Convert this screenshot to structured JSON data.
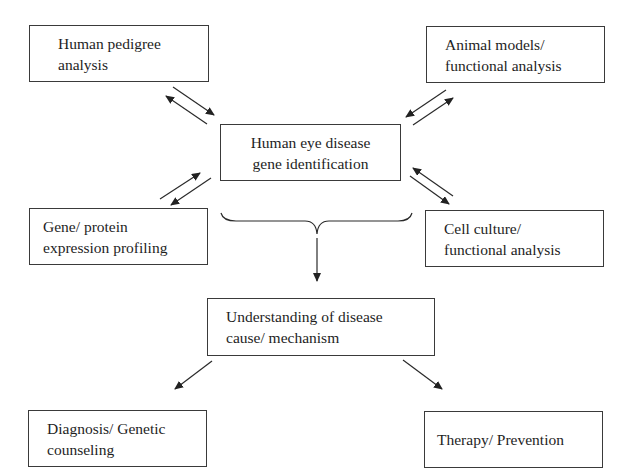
{
  "diagram": {
    "type": "flowchart",
    "nodes": [
      {
        "id": "pedigree",
        "label": "Human pedigree\nanalysis"
      },
      {
        "id": "animal",
        "label": "Animal models/\nfunctional analysis"
      },
      {
        "id": "center",
        "label": "Human eye disease\ngene identification"
      },
      {
        "id": "expression",
        "label": "Gene/ protein\nexpression profiling"
      },
      {
        "id": "cell",
        "label": "Cell culture/\nfunctional analysis"
      },
      {
        "id": "understanding",
        "label": "Understanding of disease\ncause/ mechanism"
      },
      {
        "id": "diagnosis",
        "label": "Diagnosis/ Genetic\ncounseling"
      },
      {
        "id": "therapy",
        "label": "Therapy/ Prevention"
      }
    ],
    "edges": [
      {
        "from": "pedigree",
        "to": "center",
        "bidirectional": true
      },
      {
        "from": "animal",
        "to": "center",
        "bidirectional": true
      },
      {
        "from": "expression",
        "to": "center",
        "bidirectional": true
      },
      {
        "from": "cell",
        "to": "center",
        "bidirectional": true
      },
      {
        "from": "brace(pedigree, animal, center, expression, cell)",
        "to": "understanding",
        "bidirectional": false
      },
      {
        "from": "understanding",
        "to": "diagnosis",
        "bidirectional": false
      },
      {
        "from": "understanding",
        "to": "therapy",
        "bidirectional": false
      }
    ],
    "colors": {
      "line": "#2a2a2a",
      "background": "#ffffff"
    }
  }
}
